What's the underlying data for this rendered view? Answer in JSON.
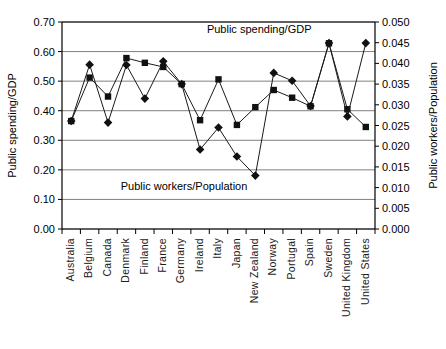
{
  "chart_data": {
    "type": "line",
    "title": "",
    "subtitle": "",
    "xlabel": "",
    "ylabel": "Public spending/GDP",
    "y2label": "Public workers/Population",
    "grid": true,
    "legend_position": "inline-annotations",
    "ylim": [
      0.0,
      0.7
    ],
    "y2lim": [
      0.0,
      0.05
    ],
    "ytick_labels": [
      "0.00",
      "0.10",
      "0.20",
      "0.30",
      "0.40",
      "0.50",
      "0.60",
      "0.70"
    ],
    "ytick_values": [
      0.0,
      0.1,
      0.2,
      0.3,
      0.4,
      0.5,
      0.6,
      0.7
    ],
    "y2tick_labels": [
      "0.000",
      "0.005",
      "0.010",
      "0.015",
      "0.020",
      "0.025",
      "0.030",
      "0.035",
      "0.040",
      "0.045",
      "0.050"
    ],
    "y2tick_values": [
      0.0,
      0.005,
      0.01,
      0.015,
      0.02,
      0.025,
      0.03,
      0.035,
      0.04,
      0.045,
      0.05
    ],
    "categories": [
      "Australia",
      "Belgium",
      "Canada",
      "Denmark",
      "Finland",
      "France",
      "Germany",
      "Ireland",
      "Italy",
      "Japan",
      "New Zealand",
      "Norway",
      "Portugal",
      "Spain",
      "Sweden",
      "United Kingdom",
      "United States"
    ],
    "series": [
      {
        "name": "Public spending/GDP",
        "axis": "left",
        "marker": "square",
        "values": [
          0.365,
          0.512,
          0.448,
          0.578,
          0.562,
          0.548,
          0.49,
          0.368,
          0.506,
          0.352,
          0.412,
          0.47,
          0.444,
          0.415,
          0.628,
          0.405,
          0.345
        ]
      },
      {
        "name": "Public workers/Population",
        "axis": "right",
        "marker": "diamond",
        "values": [
          0.0261,
          0.0397,
          0.0257,
          0.0396,
          0.0315,
          0.0405,
          0.035,
          0.0192,
          0.0245,
          0.0175,
          0.0129,
          0.0377,
          0.0358,
          0.0297,
          0.0449,
          0.0272,
          0.0449
        ]
      }
    ],
    "annotations": [
      {
        "text": "Public spending/GDP",
        "x_frac": 0.63,
        "y_px": 33
      },
      {
        "text": "Public workers/Population",
        "x_frac": 0.39,
        "y_px": 190
      }
    ]
  },
  "axes": {
    "left_title": "Public spending/GDP",
    "right_title": "Public workers/Population"
  },
  "annotations": {
    "spending": "Public spending/GDP",
    "workers": "Public workers/Population"
  }
}
